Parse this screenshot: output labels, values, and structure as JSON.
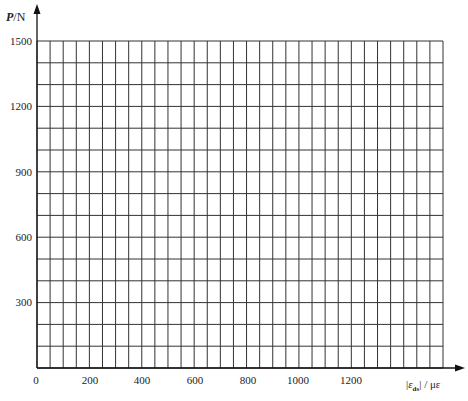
{
  "chart_data": {
    "type": "line",
    "title": "",
    "xlabel": "|ε_ds| / με",
    "ylabel": "P/N",
    "x_ticks": [
      0,
      200,
      400,
      600,
      800,
      1000,
      1200
    ],
    "y_ticks": [
      300,
      600,
      900,
      1200,
      1500
    ],
    "xlim": [
      0,
      1550
    ],
    "ylim": [
      0,
      1500
    ],
    "grid": true,
    "grid_x_step": 50,
    "grid_y_step": 100,
    "series": []
  },
  "labels": {
    "y_axis_name": "P",
    "y_axis_unit": "/N",
    "x_axis_abs_open": "|",
    "x_axis_var": "ε",
    "x_axis_sub": "ds",
    "x_axis_abs_close": "|",
    "x_axis_unit": " / με",
    "y0": "300",
    "y1": "600",
    "y2": "900",
    "y3": "1200",
    "y4": "1500",
    "x0": "0",
    "x1": "200",
    "x2": "400",
    "x3": "600",
    "x4": "800",
    "x5": "1000",
    "x6": "1200"
  },
  "colors": {
    "grid": "#333333",
    "axis": "#111111"
  }
}
